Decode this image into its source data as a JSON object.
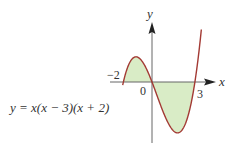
{
  "figure": {
    "equation": "y = x(x − 3)(x + 2)",
    "axis_labels": {
      "x": "x",
      "y": "y"
    },
    "tick_labels": {
      "left_root": "−2",
      "origin": "0",
      "right_root": "3"
    },
    "colors": {
      "curve": "#a33a34",
      "fill": "#d9ecc6",
      "axis": "#666666",
      "text": "#333333"
    }
  },
  "chart_data": {
    "type": "line",
    "title": "",
    "function": "y = x(x - 3)(x + 2)",
    "roots": [
      -2,
      0,
      3
    ],
    "shaded_regions": [
      {
        "from": -2,
        "to": 0,
        "sign": "positive"
      },
      {
        "from": 0,
        "to": 3,
        "sign": "negative"
      }
    ],
    "local_max": {
      "x": -1.12,
      "y": 4.06
    },
    "local_min": {
      "x": 1.79,
      "y": -8.21
    },
    "xlabel": "x",
    "ylabel": "y",
    "x_ticks": [
      "−2",
      "0",
      "3"
    ],
    "xlim": [
      -2.05,
      3.45
    ],
    "grid": false,
    "legend": "none"
  },
  "layout": {
    "origin_px": [
      152,
      82
    ],
    "scale_x": 14.3,
    "scale_y": 6.2
  }
}
